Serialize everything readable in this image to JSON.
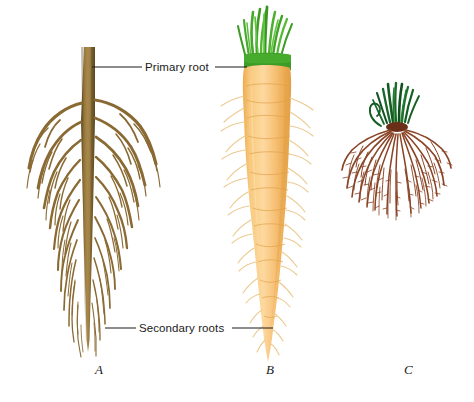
{
  "figure": {
    "background_color": "#ffffff",
    "width": 474,
    "height": 402
  },
  "callouts": [
    {
      "id": "primary-root",
      "text": "Primary root",
      "x": 147,
      "y": 62,
      "leader_left": {
        "x1": 92,
        "y1": 67,
        "x2": 142,
        "y2": 67
      },
      "leader_right": {
        "x1": 215,
        "y1": 67,
        "x2": 247,
        "y2": 67
      }
    },
    {
      "id": "secondary-roots",
      "text": "Secondary roots",
      "x": 140,
      "y": 323,
      "leader_left": {
        "x1": 105,
        "y1": 328,
        "x2": 136,
        "y2": 328
      },
      "leader_right": {
        "x1": 232,
        "y1": 328,
        "x2": 273,
        "y2": 328
      }
    }
  ],
  "panels": [
    {
      "id": "a",
      "letter": "A",
      "x": 95,
      "y": 362,
      "caption": "taproot system diagram"
    },
    {
      "id": "b",
      "letter": "B",
      "x": 266,
      "y": 362,
      "caption": "carrot taproot"
    },
    {
      "id": "c",
      "letter": "C",
      "x": 404,
      "y": 362,
      "caption": "fibrous root system"
    }
  ],
  "colors": {
    "root_brown_dark": "#6b5526",
    "root_brown": "#8a6a33",
    "root_brown_light": "#a98a4e",
    "carrot_orange": "#f5ba63",
    "carrot_orange_light": "#fbd79b",
    "carrot_orange_dark": "#e8a84e",
    "carrot_hair": "#e9c78c",
    "leaf_green_bright": "#4aa82e",
    "leaf_green_dark": "#1f7a20",
    "leaf_green_deep": "#14532d",
    "fibrous_root": "#8a4426",
    "leader_line": "#1a1a1a",
    "text": "#1a1a1a"
  }
}
